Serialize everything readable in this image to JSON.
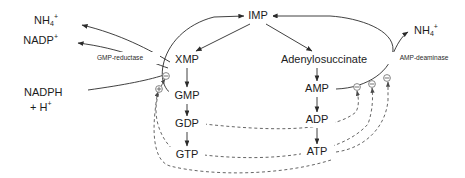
{
  "diagram": {
    "width": 465,
    "height": 178,
    "background_color": "#ffffff",
    "line_color": "#2b2b2b",
    "dashed_line_color": "#4a4a4a",
    "text_color": "#1c1c1c"
  },
  "nodes": {
    "imp": {
      "label": "IMP",
      "x": 258,
      "y": 16
    },
    "xmp": {
      "label": "XMP",
      "x": 187,
      "y": 60
    },
    "gmp": {
      "label": "GMP",
      "x": 187,
      "y": 96
    },
    "gdp": {
      "label": "GDP",
      "x": 187,
      "y": 124
    },
    "gtp": {
      "label": "GTP",
      "x": 187,
      "y": 155
    },
    "adenylosuccinate": {
      "label": "Adenylosuccinate",
      "x": 324,
      "y": 60
    },
    "amp": {
      "label": "AMP",
      "x": 317,
      "y": 89
    },
    "adp": {
      "label": "ADP",
      "x": 317,
      "y": 120
    },
    "atp": {
      "label": "ATP",
      "x": 317,
      "y": 152
    }
  },
  "cofactors": {
    "ammonium_left": {
      "base": "NH",
      "subscript": "4",
      "superscript": "+",
      "x": 48,
      "y": 21
    },
    "nadp_plus": {
      "base": "NADP",
      "superscript": "+",
      "x": 40,
      "y": 41
    },
    "nadph": {
      "base": "NADPH",
      "x": 48,
      "y": 93
    },
    "nadph_proton": {
      "base": "+ H",
      "superscript": "+",
      "x": 50,
      "y": 108
    },
    "ammonium_right": {
      "base": "NH",
      "subscript": "4",
      "superscript": "+",
      "x": 428,
      "y": 31
    }
  },
  "enzymes": {
    "gmp_reductase": {
      "label": "GMP-reductase",
      "x": 120,
      "y": 58
    },
    "amp_deaminase": {
      "label": "AMP-deaminase",
      "x": 424,
      "y": 58
    }
  },
  "regulation": {
    "symbols": [
      {
        "name": "xmp-inhibition",
        "sign": "minus",
        "x": 166,
        "y": 76
      },
      {
        "name": "gmp-reductase-activation",
        "sign": "plus",
        "x": 159,
        "y": 89
      },
      {
        "name": "amp-feedback-one",
        "sign": "minus",
        "x": 357,
        "y": 87
      },
      {
        "name": "amp-feedback-two",
        "sign": "minus",
        "x": 372,
        "y": 84
      },
      {
        "name": "amp-feedback-three",
        "sign": "minus",
        "x": 387,
        "y": 78
      }
    ],
    "legend": {
      "minus": "⊖",
      "plus": "⊕"
    }
  },
  "edges": {
    "solid": [
      "imp-to-xmp",
      "xmp-to-gmp",
      "gmp-to-gdp",
      "gdp-to-gtp",
      "imp-to-adenylosuccinate",
      "adenylosuccinate-to-amp",
      "amp-to-adp",
      "adp-to-atp",
      "gmp-reductase-arc-to-imp",
      "amp-deaminase-arc-to-imp",
      "gmp-reductase-to-ammonium",
      "gmp-reductase-to-nadp",
      "nadph-to-gmp-reductase",
      "amp-deaminase-to-ammonium"
    ],
    "dashed": [
      "gtp-feedback-to-xmp",
      "gtp-activates-amp-branch",
      "gdp-feedback-to-amp-branch",
      "atp-activates-gmp-branch",
      "atp-feedback-one",
      "atp-feedback-two"
    ]
  }
}
